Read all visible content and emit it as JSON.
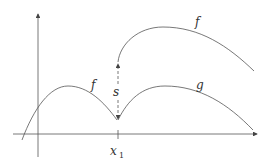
{
  "diagram": {
    "labels": {
      "f_upper": "f",
      "f_lower": "f",
      "g": "g",
      "s": "s",
      "x1_main": "x",
      "x1_sub": "1"
    },
    "colors": {
      "stroke": "#555555",
      "text": "#333333"
    }
  }
}
